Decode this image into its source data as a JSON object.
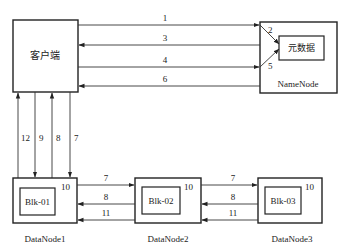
{
  "diagram": {
    "client": {
      "label": "客户端"
    },
    "namenode": {
      "label": "NameNode",
      "metadata_label": "元数据",
      "in_labels": [
        "2",
        "5"
      ]
    },
    "datanodes": [
      {
        "label": "DataNode1",
        "block": "Blk-01",
        "corner": "10"
      },
      {
        "label": "DataNode2",
        "block": "Blk-02",
        "corner": "10"
      },
      {
        "label": "DataNode3",
        "block": "Blk-03",
        "corner": "10"
      }
    ],
    "client_namenode_arrows": [
      {
        "label": "1",
        "direction": "client-to-namenode"
      },
      {
        "label": "3",
        "direction": "namenode-to-client"
      },
      {
        "label": "4",
        "direction": "client-to-namenode"
      },
      {
        "label": "6",
        "direction": "namenode-to-client"
      }
    ],
    "client_datanode_arrows": [
      {
        "label": "12",
        "direction": "datanode1-to-client"
      },
      {
        "label": "9",
        "direction": "client-to-datanode1"
      },
      {
        "label": "8",
        "direction": "datanode1-to-client"
      },
      {
        "label": "7",
        "direction": "client-to-datanode1"
      }
    ],
    "pipeline_arrows": [
      {
        "from": "DataNode1",
        "to": "DataNode2",
        "label": "7"
      },
      {
        "from": "DataNode2",
        "to": "DataNode1",
        "label": "8"
      },
      {
        "from": "DataNode2",
        "to": "DataNode1",
        "label": "11"
      },
      {
        "from": "DataNode2",
        "to": "DataNode3",
        "label": "7"
      },
      {
        "from": "DataNode3",
        "to": "DataNode2",
        "label": "8"
      },
      {
        "from": "DataNode3",
        "to": "DataNode2",
        "label": "11"
      }
    ]
  }
}
